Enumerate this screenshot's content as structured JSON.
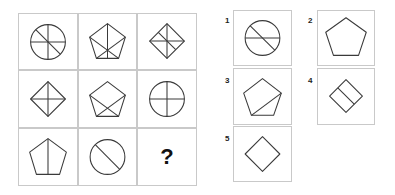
{
  "puzzle": {
    "grid": [
      {
        "id": "r1c1",
        "shape": "circle",
        "lines": "vertical + horizontal + diagonal (top-left to bottom-right)"
      },
      {
        "id": "r1c2",
        "shape": "pentagon",
        "lines": "vertical from top vertex + two diagonals crossing"
      },
      {
        "id": "r1c3",
        "shape": "diamond",
        "lines": "vertical + horizontal + one diagonal-parallel segment"
      },
      {
        "id": "r2c1",
        "shape": "diamond",
        "lines": "vertical + horizontal"
      },
      {
        "id": "r2c2",
        "shape": "pentagon",
        "lines": "two diagonals crossing near base"
      },
      {
        "id": "r2c3",
        "shape": "circle",
        "lines": "vertical + horizontal"
      },
      {
        "id": "r3c1",
        "shape": "pentagon",
        "lines": "vertical from top vertex"
      },
      {
        "id": "r3c2",
        "shape": "circle",
        "lines": "diagonal (top-left to bottom-right)"
      },
      {
        "id": "r3c3",
        "shape": "missing",
        "lines": ""
      }
    ],
    "missing_symbol": "?",
    "options": [
      {
        "label": "1",
        "shape": "circle",
        "lines": "horizontal + diagonal"
      },
      {
        "label": "2",
        "shape": "pentagon",
        "lines": "none"
      },
      {
        "label": "3",
        "shape": "pentagon",
        "lines": "one diagonal from right vertex to bottom-left vertex"
      },
      {
        "label": "4",
        "shape": "diamond",
        "lines": "one parallel segment across middle"
      },
      {
        "label": "5",
        "shape": "diamond",
        "lines": "none"
      }
    ]
  },
  "colors": {
    "stroke": "#3a3a3a",
    "border": "#c9c9c9",
    "background": "#ffffff"
  }
}
